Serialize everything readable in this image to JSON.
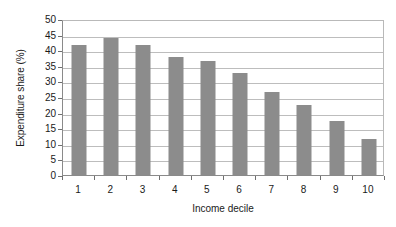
{
  "chart_data": {
    "type": "bar",
    "title": "",
    "xlabel": "Income decile",
    "ylabel": "Expenditure share (%)",
    "categories": [
      "1",
      "2",
      "3",
      "4",
      "5",
      "6",
      "7",
      "8",
      "9",
      "10"
    ],
    "values": [
      41.8,
      43.8,
      41.7,
      37.7,
      36.5,
      32.7,
      26.6,
      22.5,
      17.4,
      11.4
    ],
    "ylim": [
      0,
      50
    ],
    "ytick_step": 5,
    "yticks": [
      0,
      5,
      10,
      15,
      20,
      25,
      30,
      35,
      40,
      45,
      50
    ],
    "ytick_labels": [
      "0",
      "5",
      "10",
      "15",
      "20",
      "25",
      "30",
      "35",
      "40",
      "45",
      "50"
    ],
    "grid": "horizontal",
    "legend": "none",
    "series": [
      {
        "name": "Expenditure share",
        "values": [
          41.8,
          43.8,
          41.7,
          37.7,
          36.5,
          32.7,
          26.6,
          22.5,
          17.4,
          11.4
        ]
      }
    ],
    "colors": {
      "bar_fill": "#8c8c8c",
      "gridline": "#bdbdbd",
      "axis": "#8a8a8a",
      "plot_background": "#ffffff",
      "text": "#1a1a1a"
    }
  }
}
